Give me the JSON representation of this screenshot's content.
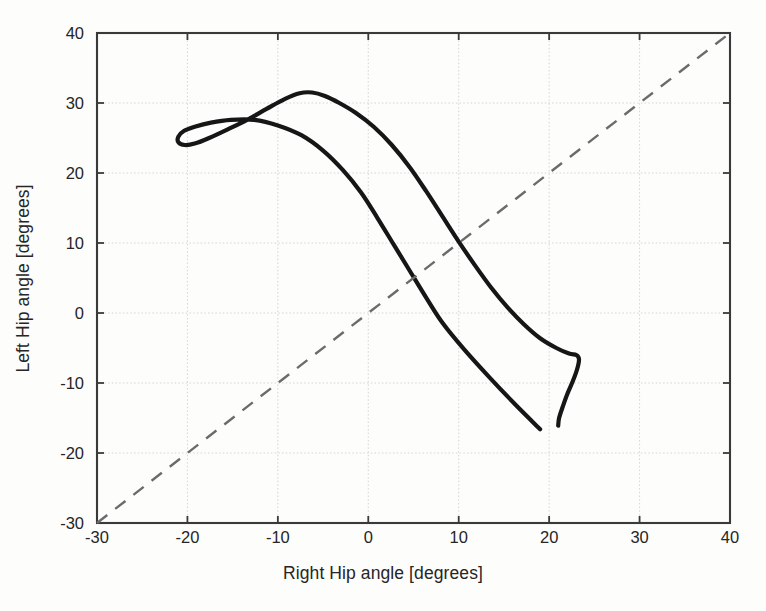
{
  "chart_data": {
    "type": "line",
    "title": "",
    "subtitle": "",
    "xlabel": "Right Hip angle [degrees]",
    "ylabel": "Left Hip angle [degrees]",
    "xlim": [
      -30,
      40
    ],
    "ylim": [
      -30,
      40
    ],
    "xticks": [
      -30,
      -20,
      -10,
      0,
      10,
      20,
      30,
      40
    ],
    "yticks": [
      -30,
      -20,
      -10,
      0,
      10,
      20,
      30,
      40
    ],
    "xtick_labels": [
      "-30",
      "-20",
      "-10",
      "0",
      "10",
      "20",
      "30",
      "40"
    ],
    "ytick_labels": [
      "-30",
      "-20",
      "-10",
      "0",
      "10",
      "20",
      "30",
      "40"
    ],
    "grid": true,
    "grid_color": "#cfcfcf",
    "legend": null,
    "legend_position": "none",
    "background_color": "#ffffff",
    "axis_color": "#3a3a3a",
    "series": [
      {
        "name": "Hip angle cyclogram",
        "type": "line",
        "style": "solid",
        "color": "#161616",
        "width": 4.2,
        "closed": false,
        "points": [
          [
            19.0,
            -16.6
          ],
          [
            16.2,
            -13.0
          ],
          [
            13.4,
            -9.2
          ],
          [
            10.6,
            -5.2
          ],
          [
            8.2,
            -1.4
          ],
          [
            6.4,
            2.2
          ],
          [
            4.6,
            6.0
          ],
          [
            2.8,
            9.8
          ],
          [
            1.0,
            13.6
          ],
          [
            -0.8,
            17.2
          ],
          [
            -2.8,
            20.4
          ],
          [
            -5.0,
            23.2
          ],
          [
            -7.4,
            25.4
          ],
          [
            -10.0,
            26.8
          ],
          [
            -12.6,
            27.6
          ],
          [
            -15.2,
            27.6
          ],
          [
            -17.4,
            27.2
          ],
          [
            -19.2,
            26.6
          ],
          [
            -20.4,
            26.0
          ],
          [
            -21.0,
            25.2
          ],
          [
            -21.0,
            24.4
          ],
          [
            -20.3,
            24.0
          ],
          [
            -19.2,
            24.2
          ],
          [
            -17.6,
            25.0
          ],
          [
            -15.6,
            26.2
          ],
          [
            -13.4,
            27.6
          ],
          [
            -11.2,
            29.2
          ],
          [
            -9.2,
            30.6
          ],
          [
            -7.6,
            31.4
          ],
          [
            -6.2,
            31.5
          ],
          [
            -4.8,
            31.0
          ],
          [
            -3.2,
            30.0
          ],
          [
            -1.4,
            28.6
          ],
          [
            0.6,
            26.6
          ],
          [
            2.6,
            24.0
          ],
          [
            4.6,
            20.8
          ],
          [
            6.4,
            17.4
          ],
          [
            8.2,
            13.8
          ],
          [
            10.0,
            10.2
          ],
          [
            11.8,
            6.8
          ],
          [
            13.6,
            3.6
          ],
          [
            15.4,
            0.8
          ],
          [
            17.2,
            -1.6
          ],
          [
            19.0,
            -3.6
          ],
          [
            20.8,
            -5.0
          ],
          [
            22.2,
            -5.8
          ],
          [
            23.0,
            -6.0
          ],
          [
            23.3,
            -6.6
          ],
          [
            23.1,
            -8.0
          ],
          [
            22.6,
            -9.8
          ],
          [
            22.0,
            -11.6
          ],
          [
            21.5,
            -13.4
          ],
          [
            21.1,
            -15.0
          ],
          [
            21.0,
            -16.1
          ]
        ]
      },
      {
        "name": "Identity line (y = x)",
        "type": "line",
        "style": "dashed",
        "color": "#6b6b6b",
        "width": 2.4,
        "closed": false,
        "points": [
          [
            -30,
            -30
          ],
          [
            40,
            40
          ]
        ]
      }
    ],
    "annotations": []
  },
  "figure": {
    "xlabel": "Right Hip angle [degrees]",
    "ylabel": "Left Hip angle [degrees]"
  },
  "axes": {
    "x_ticks": [
      {
        "value": -30,
        "label": "-30"
      },
      {
        "value": -20,
        "label": "-20"
      },
      {
        "value": -10,
        "label": "-10"
      },
      {
        "value": 0,
        "label": "0"
      },
      {
        "value": 10,
        "label": "10"
      },
      {
        "value": 20,
        "label": "20"
      },
      {
        "value": 30,
        "label": "30"
      },
      {
        "value": 40,
        "label": "40"
      }
    ],
    "y_ticks": [
      {
        "value": 40,
        "label": "40"
      },
      {
        "value": 30,
        "label": "30"
      },
      {
        "value": 20,
        "label": "20"
      },
      {
        "value": 10,
        "label": "10"
      },
      {
        "value": 0,
        "label": "0"
      },
      {
        "value": -10,
        "label": "-10"
      },
      {
        "value": -20,
        "label": "-20"
      },
      {
        "value": -30,
        "label": "-30"
      }
    ]
  },
  "colors": {
    "curve": "#161616",
    "reference_line": "#6b6b6b",
    "grid": "#cfcfcf",
    "axis": "#3a3a3a",
    "text": "#262626",
    "background": "#ffffff"
  },
  "geometry": {
    "plot_left": 97,
    "plot_top": 33,
    "plot_right": 730,
    "plot_bottom": 523
  }
}
